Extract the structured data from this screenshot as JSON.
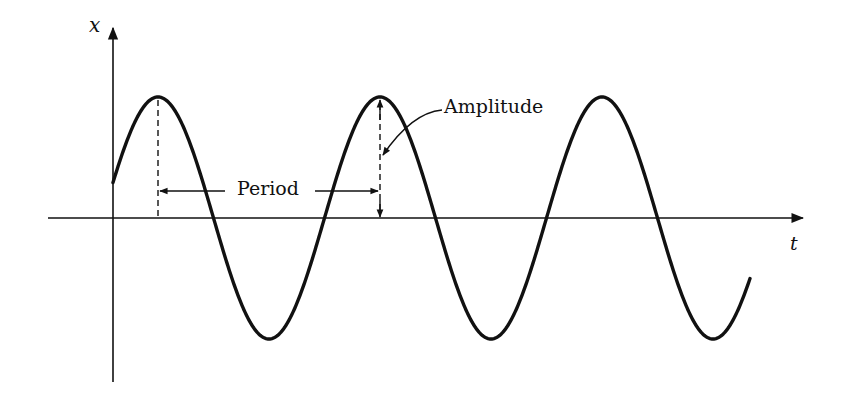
{
  "diagram": {
    "axes": {
      "x_axis_label": "t",
      "y_axis_label": "x"
    },
    "annotations": {
      "period": "Period",
      "amplitude": "Amplitude"
    },
    "geometry": {
      "origin": [
        113,
        218
      ],
      "amplitude_px": 121,
      "period_px": 222,
      "first_peak_x": 158,
      "curve_start_x": 113,
      "curve_end_x": 750
    },
    "colors": {
      "ink": "#111111",
      "background": "#ffffff"
    }
  }
}
